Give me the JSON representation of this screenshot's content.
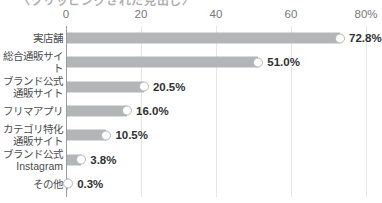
{
  "chart_data": {
    "type": "bar",
    "orientation": "horizontal",
    "title": "",
    "xlabel": "",
    "ylabel": "",
    "xlim": [
      0,
      80
    ],
    "xticks": [
      0,
      20,
      40,
      60,
      80
    ],
    "xtick_labels": [
      "0",
      "20",
      "40",
      "60",
      "80%"
    ],
    "grid": true,
    "legend": false,
    "categories": [
      "実店舗",
      "総合通販サイト",
      "ブランド公式\n通販サイト",
      "フリマアプリ",
      "カテゴリ特化\n通販サイト",
      "ブランド公式\nInstagram",
      "その他"
    ],
    "values": [
      72.8,
      51.0,
      20.5,
      16.0,
      10.5,
      3.8,
      0.3
    ],
    "value_labels": [
      "72.8%",
      "51.0%",
      "20.5%",
      "16.0%",
      "10.5%",
      "3.8%",
      "0.3%"
    ],
    "bar_color": "#b4b5b7",
    "marker_color": "#ffffff",
    "gridline_color": "#e4e6e8",
    "axis_color": "#9a9c9e",
    "label_color": "#4a4c4e",
    "value_label_color": "#2f3133"
  },
  "title_fragment": {
    "text": "〈クリッピングされた見出し〉"
  }
}
